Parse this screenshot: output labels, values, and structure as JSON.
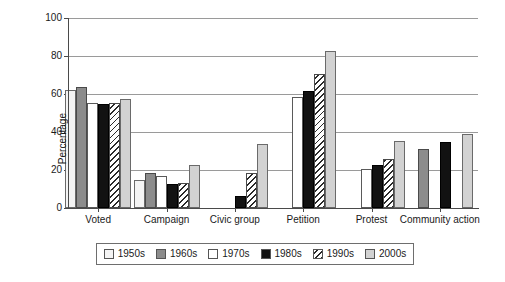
{
  "chart_data": {
    "type": "bar",
    "title": "",
    "xlabel": "",
    "ylabel": "Percentage",
    "ylim": [
      0,
      100
    ],
    "ytick_values": [
      0,
      20,
      40,
      60,
      80,
      100
    ],
    "ytick_labels": [
      "0",
      "20",
      "40",
      "60",
      "80",
      "100"
    ],
    "grid": true,
    "legend_position": "bottom",
    "categories": [
      "Voted",
      "Campaign",
      "Civic group",
      "Petition",
      "Protest",
      "Community action"
    ],
    "series": [
      {
        "name": "1950s",
        "color": "#f4f4f4",
        "pattern": "solid",
        "values": [
          62,
          15,
          null,
          null,
          null,
          null
        ]
      },
      {
        "name": "1960s",
        "color": "#8c8c8c",
        "pattern": "solid",
        "values": [
          63.5,
          18.5,
          null,
          null,
          null,
          31
        ]
      },
      {
        "name": "1970s",
        "color": "#ffffff",
        "pattern": "solid",
        "values": [
          55.5,
          17,
          null,
          58.5,
          20.5,
          null
        ]
      },
      {
        "name": "1980s",
        "color": "#121212",
        "pattern": "solid",
        "values": [
          54.5,
          12.5,
          6.5,
          61.5,
          22.5,
          35
        ]
      },
      {
        "name": "1990s",
        "color": "#ffffff",
        "pattern": "diagonal-hatch",
        "values": [
          55.5,
          13,
          18.5,
          70.5,
          26,
          null
        ]
      },
      {
        "name": "2000s",
        "color": "#d2d2d2",
        "pattern": "solid",
        "values": [
          57.5,
          22.5,
          33.5,
          82.5,
          35.5,
          39
        ]
      }
    ]
  },
  "legend": {
    "items": [
      {
        "label": "1950s"
      },
      {
        "label": "1960s"
      },
      {
        "label": "1970s"
      },
      {
        "label": "1980s"
      },
      {
        "label": "1990s"
      },
      {
        "label": "2000s"
      }
    ]
  }
}
